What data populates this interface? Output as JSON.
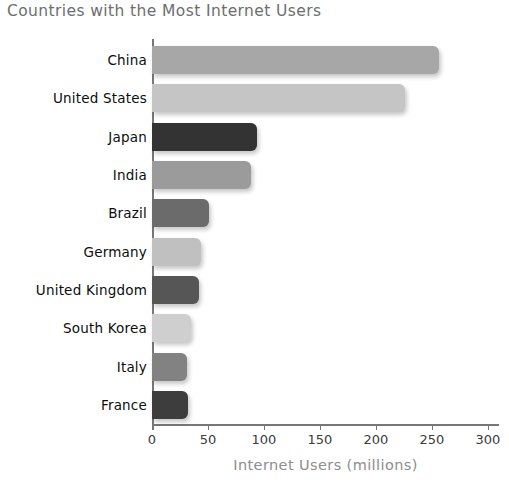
{
  "chart_data": {
    "type": "bar",
    "orientation": "horizontal",
    "title": "Countries with the Most Internet Users",
    "xlabel": "Internet Users (millions)",
    "ylabel": "",
    "xlim": [
      0,
      310
    ],
    "xticks": [
      0,
      50,
      100,
      150,
      200,
      250,
      300
    ],
    "xtick_labels": [
      "0",
      "50",
      "100",
      "150",
      "200",
      "250",
      "300"
    ],
    "grid": false,
    "legend": "none",
    "categories": [
      "China",
      "United States",
      "Japan",
      "India",
      "Brazil",
      "Germany",
      "United Kingdom",
      "South Korea",
      "Italy",
      "France"
    ],
    "values": [
      256,
      226,
      94,
      88,
      51,
      44,
      42,
      35,
      31,
      32
    ],
    "bar_colors": [
      "#a7a7a7",
      "#c5c5c5",
      "#333333",
      "#9b9b9b",
      "#6b6b6b",
      "#c0c0c0",
      "#565656",
      "#cfcfcf",
      "#828282",
      "#3d3d3d"
    ]
  },
  "style": {
    "title_color": "#6e6e6e",
    "axis_color": "#777777",
    "tick_label_color": "#3b3b3b",
    "category_label_color": "#0d0d0d",
    "xaxis_title_color": "#8d8d8d",
    "background": "#ffffff"
  }
}
